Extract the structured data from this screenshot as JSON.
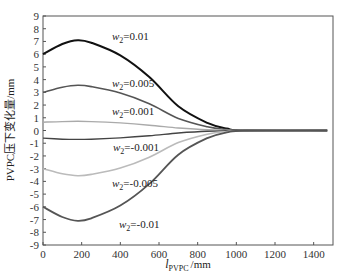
{
  "chart_data": {
    "type": "line",
    "title": "",
    "xlabel": "l_PVPC /mm",
    "xlabel_main": "l",
    "xlabel_sub": "PVPC",
    "xlabel_unit": "/mm",
    "ylabel": "PVPC压下变化量/mm",
    "xlim": [
      0,
      1500
    ],
    "ylim": [
      -9,
      9
    ],
    "xticks": [
      0,
      200,
      400,
      600,
      800,
      1000,
      1200,
      1400
    ],
    "yticks": [
      9,
      8,
      7,
      6,
      5,
      4,
      3,
      2,
      1,
      0,
      -1,
      -2,
      -3,
      -4,
      -5,
      -6,
      -7,
      -8,
      -9
    ],
    "grid": false,
    "legend": "inline annotations",
    "x": [
      0,
      100,
      180,
      250,
      400,
      550,
      700,
      850,
      950,
      1050,
      1470
    ],
    "series": [
      {
        "name": "w2=0.01",
        "label_main": "w",
        "label_sub": "2",
        "label_val": "=0.01",
        "color": "#111111",
        "width": 2.0,
        "label_pos": [
          112,
          40
        ],
        "values": [
          6.0,
          6.8,
          7.1,
          6.9,
          5.9,
          4.2,
          1.9,
          0.6,
          0.15,
          0.0,
          0.0
        ]
      },
      {
        "name": "w2=0.005",
        "label_main": "w",
        "label_sub": "2",
        "label_val": "=0.005",
        "color": "#555555",
        "width": 1.6,
        "label_pos": [
          112,
          87
        ],
        "values": [
          3.0,
          3.4,
          3.55,
          3.45,
          2.95,
          2.1,
          0.95,
          0.3,
          0.08,
          0.0,
          0.0
        ]
      },
      {
        "name": "w2=0.001",
        "label_main": "w",
        "label_sub": "2",
        "label_val": "=0.001",
        "color": "#aaaaaa",
        "width": 1.4,
        "label_pos": [
          112,
          115
        ],
        "values": [
          0.65,
          0.7,
          0.72,
          0.7,
          0.6,
          0.42,
          0.2,
          0.06,
          0.02,
          0.0,
          0.0
        ]
      },
      {
        "name": "w2=-0.001",
        "label_main": "w",
        "label_sub": "2",
        "label_val": "=-0.001",
        "color": "#444444",
        "width": 1.4,
        "label_pos": [
          113,
          151
        ],
        "values": [
          -0.6,
          -0.68,
          -0.7,
          -0.68,
          -0.58,
          -0.42,
          -0.2,
          -0.06,
          -0.02,
          0.0,
          0.0
        ]
      },
      {
        "name": "w2=-0.005",
        "label_main": "w",
        "label_sub": "2",
        "label_val": "=-0.005",
        "color": "#bbbbbb",
        "width": 1.6,
        "label_pos": [
          112,
          187
        ],
        "values": [
          -3.0,
          -3.4,
          -3.55,
          -3.45,
          -2.95,
          -2.1,
          -0.95,
          -0.3,
          -0.08,
          0.0,
          0.0
        ]
      },
      {
        "name": "w2=-0.01",
        "label_main": "w",
        "label_sub": "2",
        "label_val": "=-0.01",
        "color": "#555555",
        "width": 1.8,
        "label_pos": [
          119,
          228
        ],
        "values": [
          -6.0,
          -6.8,
          -7.1,
          -6.9,
          -5.9,
          -4.2,
          -1.9,
          -0.6,
          -0.15,
          0.0,
          0.0
        ]
      }
    ]
  }
}
